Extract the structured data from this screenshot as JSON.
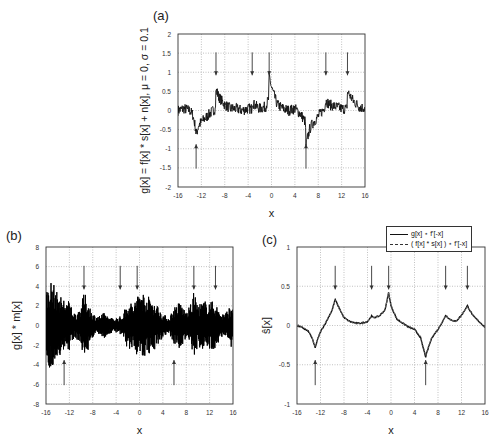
{
  "chart_data": [
    {
      "panel": "(a)",
      "type": "line",
      "title": "",
      "xlabel": "x",
      "ylabel": "g[x] = f[x] * s[x] + n[x], μ = 0, σ = 0.1",
      "xlim": [
        -16,
        16
      ],
      "ylim": [
        -2,
        2
      ],
      "xticks": [
        -16,
        -12,
        -8,
        -4,
        0,
        4,
        8,
        12,
        16
      ],
      "yticks": [
        -2,
        -1.5,
        -1,
        -0.5,
        0,
        0.5,
        1,
        1.5,
        2
      ],
      "grid": true,
      "down_arrows_x": [
        -9.5,
        -3.3,
        -0.4,
        9.3,
        13
      ],
      "up_arrows_x": [
        -12.9,
        5.9
      ],
      "series": [
        {
          "name": "g[x]",
          "style": "solid-noisy",
          "x": [
            -16,
            -15,
            -14,
            -13.5,
            -13,
            -12.9,
            -12.5,
            -12,
            -11,
            -10,
            -9.6,
            -9.5,
            -9,
            -8,
            -7,
            -6,
            -5,
            -4,
            -3.4,
            -3.3,
            -3,
            -2,
            -1,
            -0.5,
            -0.4,
            0,
            1,
            2,
            3,
            4,
            5,
            5.8,
            5.9,
            6.5,
            7,
            8,
            9,
            9.3,
            10,
            11,
            12,
            12.9,
            13,
            14,
            15,
            16
          ],
          "y": [
            0,
            0.05,
            0,
            -0.1,
            -0.45,
            -0.65,
            -0.4,
            -0.3,
            -0.15,
            0,
            0.05,
            0.55,
            0.35,
            0.15,
            0.05,
            0.05,
            0,
            0.05,
            0.05,
            0.25,
            0.15,
            0.05,
            0.1,
            0.3,
            0.9,
            0.6,
            0.15,
            0.05,
            0,
            0.05,
            -0.1,
            -0.3,
            -0.9,
            -0.5,
            -0.35,
            -0.15,
            0.05,
            0.25,
            0.15,
            0.1,
            0.05,
            0.05,
            0.5,
            0.25,
            0.1,
            0.05
          ]
        }
      ]
    },
    {
      "panel": "(b)",
      "type": "line",
      "title": "",
      "xlabel": "x",
      "ylabel": "g[x] * m[x]",
      "xlim": [
        -16,
        16
      ],
      "ylim": [
        -8,
        8
      ],
      "xticks": [
        -16,
        -12,
        -8,
        -4,
        0,
        4,
        8,
        12,
        16
      ],
      "yticks": [
        -8,
        -6,
        -4,
        -2,
        0,
        2,
        4,
        6,
        8
      ],
      "grid": true,
      "down_arrows_x": [
        -9.5,
        -3.3,
        -0.4,
        9.3,
        13
      ],
      "up_arrows_x": [
        -12.9,
        5.9
      ],
      "series": [
        {
          "name": "g[x]*m[x] envelope",
          "style": "dense-oscillation",
          "x": [
            -16,
            -15,
            -14,
            -13,
            -12,
            -11,
            -10,
            -9.5,
            -9,
            -8,
            -7,
            -6,
            -5,
            -4,
            -3,
            -2,
            -1,
            0,
            1,
            2,
            3,
            4,
            5,
            6,
            7,
            8,
            9,
            9.3,
            10,
            11,
            12,
            13,
            14,
            15,
            16
          ],
          "y": [
            3.5,
            4.8,
            3.2,
            2.8,
            2.5,
            1.2,
            2,
            3.5,
            2.8,
            1.2,
            1,
            1.3,
            0.8,
            0.8,
            1,
            2.5,
            2.2,
            3.8,
            3.2,
            2.8,
            2.2,
            1.2,
            0.8,
            2,
            2.5,
            1.3,
            2.5,
            3.5,
            2.2,
            2.5,
            2.6,
            2.3,
            1.2,
            1.5,
            2.5
          ]
        }
      ]
    },
    {
      "panel": "(c)",
      "type": "line",
      "title": "",
      "xlabel": "x",
      "ylabel": "ŝ[x]",
      "xlim": [
        -16,
        16
      ],
      "ylim": [
        -1,
        1
      ],
      "xticks": [
        -16,
        -12,
        -8,
        -4,
        0,
        4,
        8,
        12,
        16
      ],
      "yticks": [
        -1,
        -0.5,
        0,
        0.5,
        1
      ],
      "grid": true,
      "legend": [
        "g[x] ⋆ f'[-x]",
        "( f[x] * s[x] ) ⋆ f'[-x]"
      ],
      "legend_position": "top-right (outside)",
      "down_arrows_x": [
        -9.5,
        -3.3,
        -0.4,
        9.3,
        13
      ],
      "up_arrows_x": [
        -12.9,
        5.9
      ],
      "series": [
        {
          "name": "g[x] ⋆ f'[-x]",
          "style": "solid",
          "x": [
            -16,
            -15,
            -14,
            -13.5,
            -12.9,
            -12.5,
            -12,
            -11,
            -10,
            -9.5,
            -9,
            -8,
            -7,
            -6,
            -5,
            -4,
            -3.3,
            -3,
            -2,
            -1,
            -0.4,
            0,
            1,
            2,
            3,
            4,
            5,
            5.9,
            6.5,
            7,
            8,
            9,
            9.3,
            10,
            11,
            12,
            13,
            14,
            15,
            16
          ],
          "y": [
            0,
            -0.03,
            -0.08,
            -0.15,
            -0.28,
            -0.18,
            -0.08,
            0.05,
            0.2,
            0.33,
            0.25,
            0.1,
            0.05,
            0.03,
            0.03,
            0.05,
            0.12,
            0.1,
            0.12,
            0.2,
            0.42,
            0.25,
            0.08,
            0.03,
            -0.02,
            -0.05,
            -0.15,
            -0.4,
            -0.25,
            -0.15,
            -0.05,
            0.08,
            0.13,
            0.08,
            0.05,
            0.13,
            0.25,
            0.12,
            0.05,
            -0.02
          ]
        },
        {
          "name": "( f[x] * s[x] ) ⋆ f'[-x]",
          "style": "dashed",
          "x": [
            -16,
            -15,
            -14,
            -13.5,
            -12.9,
            -12.5,
            -12,
            -11,
            -10,
            -9.5,
            -9,
            -8,
            -7,
            -6,
            -5,
            -4,
            -3.3,
            -3,
            -2,
            -1,
            -0.4,
            0,
            1,
            2,
            3,
            4,
            5,
            5.9,
            6.5,
            7,
            8,
            9,
            9.3,
            10,
            11,
            12,
            13,
            14,
            15,
            16
          ],
          "y": [
            0,
            -0.02,
            -0.07,
            -0.14,
            -0.27,
            -0.17,
            -0.07,
            0.06,
            0.2,
            0.32,
            0.24,
            0.1,
            0.05,
            0.03,
            0.03,
            0.05,
            0.11,
            0.1,
            0.12,
            0.2,
            0.41,
            0.26,
            0.09,
            0.03,
            -0.01,
            -0.04,
            -0.14,
            -0.38,
            -0.24,
            -0.14,
            -0.05,
            0.08,
            0.12,
            0.08,
            0.05,
            0.13,
            0.24,
            0.12,
            0.05,
            -0.02
          ]
        }
      ]
    }
  ],
  "labels": {
    "a": "(a)",
    "b": "(b)",
    "c": "(c)"
  }
}
